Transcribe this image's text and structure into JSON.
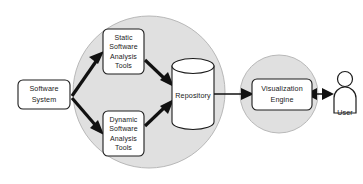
{
  "diagram": {
    "colors": {
      "environment_fill": "#e0e0e0",
      "node_fill": "#ffffff",
      "stroke": "#1c1c1c",
      "arrow": "#111111"
    },
    "nodes": {
      "software_system": {
        "label_lines": [
          "Software",
          "System"
        ],
        "line1": "Software",
        "line2": "System",
        "shape": "rounded-rectangle"
      },
      "static_tools": {
        "label_lines": [
          "Static",
          "Software",
          "Analysis",
          "Tools"
        ],
        "line1": "Static",
        "line2": "Software",
        "line3": "Analysis",
        "line4": "Tools",
        "shape": "rounded-rectangle"
      },
      "dynamic_tools": {
        "label_lines": [
          "Dynamic",
          "Software",
          "Analysis",
          "Tools"
        ],
        "line1": "Dynamic",
        "line2": "Software",
        "line3": "Analysis",
        "line4": "Tools",
        "shape": "rounded-rectangle"
      },
      "repository": {
        "label": "Repository",
        "shape": "cylinder"
      },
      "visualization_engine": {
        "label_lines": [
          "Visualization",
          "Engine"
        ],
        "line1": "Visualization",
        "line2": "Engine",
        "shape": "rounded-rectangle"
      },
      "user": {
        "label": "User",
        "shape": "actor"
      }
    },
    "groups": {
      "analysis_environment": {
        "shape": "circle"
      },
      "visualization_environment": {
        "shape": "circle"
      }
    },
    "edges": [
      {
        "from": "software_system",
        "to": "static_tools",
        "direction": "one-way"
      },
      {
        "from": "software_system",
        "to": "dynamic_tools",
        "direction": "one-way"
      },
      {
        "from": "static_tools",
        "to": "repository",
        "direction": "one-way"
      },
      {
        "from": "dynamic_tools",
        "to": "repository",
        "direction": "one-way"
      },
      {
        "from": "repository",
        "to": "visualization_engine",
        "direction": "one-way"
      },
      {
        "from": "visualization_engine",
        "to": "user",
        "direction": "two-way"
      }
    ]
  }
}
